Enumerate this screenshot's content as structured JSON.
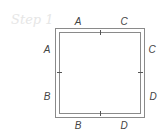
{
  "title": "Step 1",
  "labels": {
    "top": [
      "A",
      "C"
    ],
    "left": [
      "A",
      "B"
    ],
    "right": [
      "C",
      "D"
    ],
    "bottom": [
      "B",
      "D"
    ]
  },
  "colors": {
    "line": "#8a8a8a",
    "label": "#444444",
    "title": "#e6e6e6"
  }
}
